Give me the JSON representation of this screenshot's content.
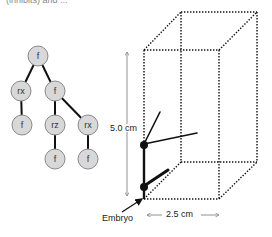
{
  "caption_fragment": "(inhibits) and ...",
  "tree": {
    "node_fill": "#d8d8d8",
    "node_stroke": "#8a8a8a",
    "edge_color": "#111111",
    "nodes": [
      {
        "id": "n0",
        "label": "f",
        "x": 38,
        "y": 56
      },
      {
        "id": "n1",
        "label": "rx",
        "x": 21,
        "y": 91
      },
      {
        "id": "n2",
        "label": "f",
        "x": 55,
        "y": 91
      },
      {
        "id": "n3",
        "label": "f",
        "x": 22,
        "y": 125
      },
      {
        "id": "n4",
        "label": "rz",
        "x": 55,
        "y": 125
      },
      {
        "id": "n5",
        "label": "rx",
        "x": 88,
        "y": 125
      },
      {
        "id": "n6",
        "label": "f",
        "x": 55,
        "y": 159
      },
      {
        "id": "n7",
        "label": "f",
        "x": 88,
        "y": 159
      }
    ],
    "edges": [
      [
        "n0",
        "n1"
      ],
      [
        "n0",
        "n2"
      ],
      [
        "n1",
        "n3"
      ],
      [
        "n2",
        "n4"
      ],
      [
        "n2",
        "n5"
      ],
      [
        "n4",
        "n6"
      ],
      [
        "n5",
        "n7"
      ]
    ]
  },
  "box": {
    "height_label": "5.0 cm",
    "width_label": "2.5 cm"
  },
  "embryo": {
    "label": "Embryo"
  }
}
